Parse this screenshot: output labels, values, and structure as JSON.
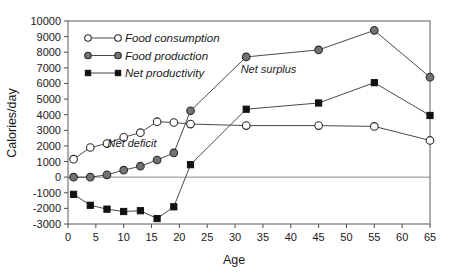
{
  "chart_data": {
    "type": "line",
    "title": "",
    "xlabel": "Age",
    "ylabel": "Calories/day",
    "xlim": [
      0,
      65
    ],
    "ylim": [
      -3000,
      10000
    ],
    "grid": false,
    "legend_position": "top-left inside plot",
    "x": [
      1,
      4,
      7,
      10,
      13,
      16,
      19,
      22,
      32,
      45,
      55,
      65
    ],
    "xticks": [
      0,
      5,
      10,
      15,
      20,
      25,
      30,
      35,
      40,
      45,
      50,
      55,
      60,
      65
    ],
    "yticks": [
      -3000,
      -2000,
      -1000,
      0,
      1000,
      2000,
      3000,
      4000,
      5000,
      6000,
      7000,
      8000,
      9000,
      10000
    ],
    "series": [
      {
        "name": "Food consumption",
        "marker": "open-circle",
        "values": [
          1150,
          1900,
          2150,
          2550,
          2850,
          3550,
          3500,
          3400,
          3300,
          3300,
          3250,
          2350
        ]
      },
      {
        "name": "Food production",
        "marker": "filled-gray-circle",
        "values": [
          0,
          0,
          150,
          450,
          700,
          1100,
          1550,
          4250,
          7700,
          8150,
          9400,
          6400
        ]
      },
      {
        "name": "Net productivity",
        "marker": "filled-black-square",
        "values": [
          -1100,
          -1800,
          -2050,
          -2200,
          -2150,
          -2650,
          -1900,
          800,
          4350,
          4750,
          6050,
          3950
        ]
      }
    ],
    "annotations": [
      {
        "text": "Net deficit",
        "x": 11.5,
        "y": 1950
      },
      {
        "text": "Net surplus",
        "x": 36.0,
        "y": 6700
      }
    ],
    "colors": {
      "food_consumption_marker_fill": "#ffffff",
      "food_production_marker_fill": "#737373",
      "net_productivity_marker_fill": "#111111",
      "line": "#4a4a4a",
      "axis": "#5a5a5a",
      "zero_line": "#8a8a8a",
      "text": "#1a1a1a",
      "background": "#ffffff"
    }
  }
}
